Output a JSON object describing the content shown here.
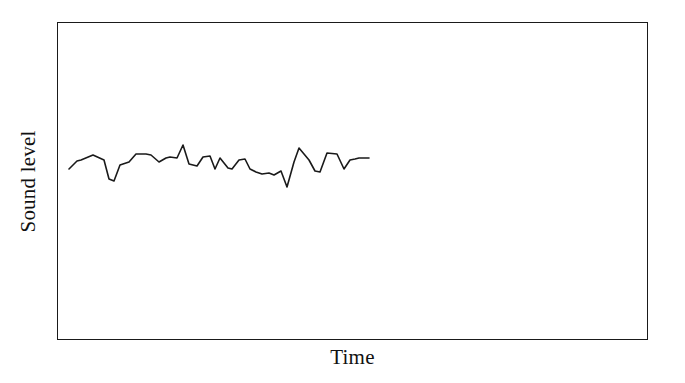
{
  "chart_data": {
    "type": "line",
    "title": "",
    "subtitle": "",
    "xlabel": "Time",
    "ylabel": "Sound level",
    "grid": false,
    "legend": null,
    "legend_position": "none",
    "annotations": [],
    "xtick_labels": [],
    "ytick_labels": [],
    "axis_ranges": {
      "x": [
        0,
        100
      ],
      "y": [
        0,
        100
      ]
    },
    "axis_note": "Axes are unlabeled and unscaled; only qualitative axis names are shown.",
    "line_color": "#1a1a1a",
    "line_width": 1.6,
    "frame_color": "#1a1a1a",
    "background_color": "#ffffff",
    "series": [
      {
        "name": "Sound level over time",
        "x": [
          2.2,
          4.2,
          6.2,
          8.0,
          10.4,
          12.6,
          14.6,
          16.6,
          18.4,
          20.4,
          22.4,
          24.4,
          26.6,
          28.6,
          30.6,
          32.6,
          34.6,
          36.6,
          38.6,
          40.6,
          42.6,
          44.6,
          46.6,
          48.6,
          50.6,
          52.6,
          54.6,
          56.6,
          58.6,
          60.6,
          62.6,
          64.6,
          66.6,
          68.6,
          70.6,
          72.6,
          74.6,
          76.6,
          78.6,
          80.6,
          82.6,
          84.6,
          86.4
        ],
        "y": [
          47.8,
          52.8,
          53.5,
          56.6,
          53.2,
          44.6,
          43.2,
          50.5,
          51.8,
          56.8,
          56.8,
          56.6,
          53.2,
          55.0,
          55.8,
          55.6,
          61.5,
          52.2,
          51.5,
          55.6,
          55.8,
          49.2,
          54.9,
          49.8,
          49.5,
          54.6,
          55.0,
          49.5,
          48.2,
          47.5,
          48.0,
          47.2,
          49.5,
          42.2,
          54.2,
          60.6,
          53.0,
          48.0,
          47.8,
          57.8,
          57.5,
          49.5,
          54.4
        ],
        "y_units": "arbitrary (unlabeled)",
        "description": "A noisy, roughly stationary signal fluctuating about a constant mean with no visible trend."
      }
    ],
    "polyline_points": "11 146 19 138 23 137 35 132 46 137 51 156 56 158 62 142 71 139 78 131 88 131 93 132 101 139 108 135 112 134 119 135 125 122 131 141 139 143 145 134 152 133 157 146 162 135 170 145 174 146 181 137 187 136 192 146 198 149 204 151 211 150 216 152 223 148 229 164 236 139 241 125 251 137 257 148 262 149 269 130 279 131 286 146 292 137 297 136 301 135 306 135 311 135"
  },
  "figure": {
    "width": 685,
    "height": 383,
    "caption": ""
  }
}
